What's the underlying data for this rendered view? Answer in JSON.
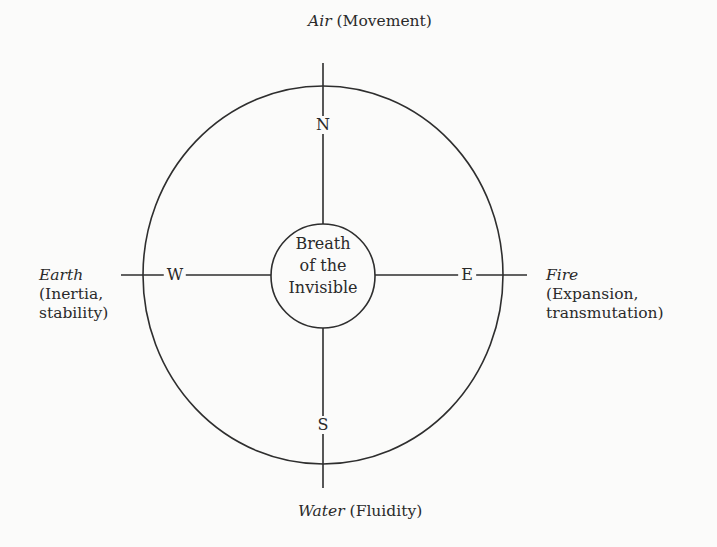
{
  "diagram": {
    "title": "",
    "center": {
      "lines": [
        "Breath",
        "of the",
        "Invisible"
      ]
    },
    "directions": {
      "north": "N",
      "south": "S",
      "west": "W",
      "east": "E"
    },
    "elements": {
      "north": {
        "element": "Air",
        "quality": "(Movement)"
      },
      "south": {
        "element": "Water",
        "quality": "(Fluidity)"
      },
      "west": {
        "element": "Earth",
        "quality_line1": "(Inertia,",
        "quality_line2": "stability)"
      },
      "east": {
        "element": "Fire",
        "quality_line1": "(Expansion,",
        "quality_line2": "transmutation)"
      }
    },
    "colors": {
      "background": "#fbfbfa",
      "ink": "#2e2e2e"
    }
  }
}
